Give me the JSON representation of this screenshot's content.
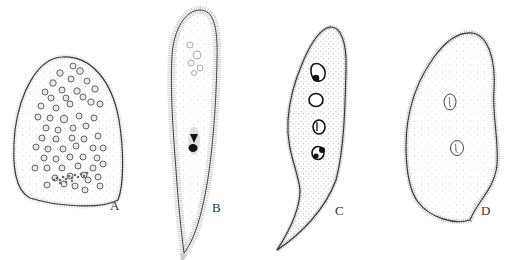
{
  "figure": {
    "type": "scientific-illustration",
    "panels": [
      {
        "label": "A",
        "description": "broad oval cell with many small nuclei and a clustered chain near the base",
        "nuclei_count_approx": 60
      },
      {
        "label": "B",
        "description": "elongate spindle-shaped cell with a dark central nucleus and a tapering tail",
        "nuclei_count_approx": 1
      },
      {
        "label": "C",
        "description": "curved comma-shaped cell with a chain of four nuclei",
        "nuclei_count_approx": 4
      },
      {
        "label": "D",
        "description": "oval cell with two small vesicular nuclei and a pointed lower end",
        "nuclei_count_approx": 2
      }
    ]
  },
  "colors": {
    "outline": "#3a3a3a",
    "cilia": "#9a9a9a",
    "cytoplasm_stipple": "#b8b8b8",
    "nucleus_dark": "#1a1a1a",
    "background": "#ffffff"
  }
}
